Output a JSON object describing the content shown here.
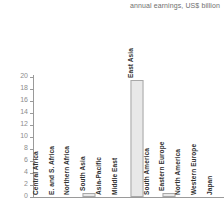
{
  "chart_data": {
    "type": "bar",
    "title": "annual earnings, US$ billion",
    "xlabel": "",
    "ylabel": "",
    "ylim": [
      0,
      20
    ],
    "ytick_labels": [
      "20",
      "18",
      "16",
      "14",
      "12",
      "10",
      "8",
      "6",
      "4",
      "2",
      "0"
    ],
    "ytick_values": [
      20,
      18,
      16,
      14,
      12,
      10,
      8,
      6,
      4,
      2,
      0
    ],
    "grid": false,
    "legend": "none",
    "categories": [
      "Central Africa",
      "E. and S. Africa",
      "Northern Africa",
      "South Asia",
      "Asia-Pacific",
      "Middle East",
      "East Asia",
      "South America",
      "Eastern Europe",
      "North America",
      "Western Europe",
      "Japan"
    ],
    "values": [
      0,
      0,
      0,
      0.7,
      0,
      0,
      19.5,
      0,
      0.7,
      0,
      0,
      0
    ],
    "bar_color": "#e8e8e8",
    "bar_border_color": "#a8a8a8",
    "axis_color": "#9a9a9a",
    "tick_label_color": "#8d8d8d",
    "category_label_color": "#2f2f2f",
    "title_color": "#6e6e6e"
  }
}
